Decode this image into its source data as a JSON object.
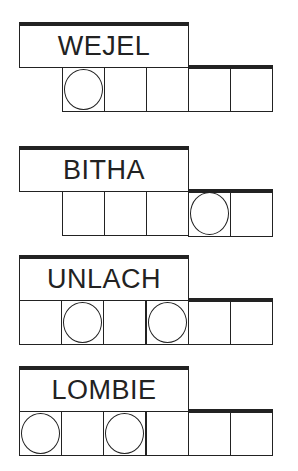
{
  "puzzles": [
    {
      "word": "WEJEL",
      "top": 22,
      "cells_start_index": 1,
      "cell_count": 5,
      "circled": [
        1
      ]
    },
    {
      "word": "BITHA",
      "top": 146,
      "cells_start_index": 1,
      "cell_count": 5,
      "circled": [
        4
      ]
    },
    {
      "word": "UNLACH",
      "top": 255,
      "cells_start_index": 0,
      "cell_count": 6,
      "circled": [
        2,
        4
      ]
    },
    {
      "word": "LOMBIE",
      "top": 366,
      "cells_start_index": 0,
      "cell_count": 6,
      "circled": [
        1,
        3
      ]
    }
  ]
}
